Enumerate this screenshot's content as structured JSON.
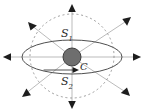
{
  "figure": {
    "type": "geometric-diagram",
    "canvas": {
      "width": 144,
      "height": 112
    },
    "colors": {
      "background": "#ffffff",
      "sphere_fill": "#6e6e6e",
      "sphere_stroke": "#3a3a3a",
      "ellipse_stroke": "#4a4a4a",
      "dashed_circle_stroke": "#8d8d8d",
      "ray_stroke": "#9a9a9a",
      "arrow_fill": "#1d1d1d",
      "label_color": "#2b2b2b"
    },
    "center": {
      "x": 72,
      "y": 57
    },
    "dashed_circle": {
      "cx": 72,
      "cy": 56,
      "r": 42,
      "dash": "2 2.6"
    },
    "equator_ellipse": {
      "cx": 72,
      "cy": 57,
      "rx": 50,
      "ry": 17
    },
    "sphere": {
      "cx": 72,
      "cy": 57,
      "r": 9
    },
    "labels": {
      "upper_surface": {
        "base": "S",
        "sub": "1",
        "text": "S1"
      },
      "lower_surface": {
        "base": "S",
        "sub": "2",
        "text": "S2"
      },
      "center_point": {
        "base": "C",
        "sub": "",
        "text": "C"
      }
    },
    "rays": [
      {
        "name": "ray-east",
        "angle_deg": 0,
        "length": 70,
        "arrow": "right"
      },
      {
        "name": "ray-northeast",
        "angle_deg": 45,
        "length": 68,
        "arrow": "up-right"
      },
      {
        "name": "ray-north",
        "angle_deg": 90,
        "length": 54,
        "arrow": "up"
      },
      {
        "name": "ray-northwest",
        "angle_deg": 135,
        "length": 68,
        "arrow": "up-left"
      },
      {
        "name": "ray-west",
        "angle_deg": 180,
        "length": 70,
        "arrow": "left"
      },
      {
        "name": "ray-southwest",
        "angle_deg": 225,
        "length": 68,
        "arrow": "down-left"
      },
      {
        "name": "ray-south",
        "angle_deg": 270,
        "length": 54,
        "arrow": "down"
      },
      {
        "name": "ray-southeast",
        "angle_deg": 315,
        "length": 68,
        "arrow": "down-right"
      }
    ],
    "center_arrow": {
      "name": "center-arrow-to-C",
      "direction": "right",
      "from_x": 60,
      "to_x": 78,
      "y": 70
    }
  }
}
